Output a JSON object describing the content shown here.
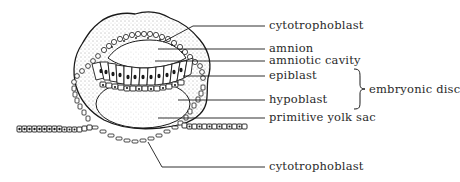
{
  "figure": {
    "title": "",
    "labels": [
      {
        "id": "cytotrophoblast-top",
        "text": "cytotrophoblast",
        "x": 269,
        "y": 20
      },
      {
        "id": "amnion",
        "text": "amnion",
        "x": 269,
        "y": 43
      },
      {
        "id": "amniotic-cavity",
        "text": "amniotic cavity",
        "x": 269,
        "y": 56
      },
      {
        "id": "epiblast",
        "text": "epiblast",
        "x": 269,
        "y": 71
      },
      {
        "id": "hypoblast",
        "text": "hypoblast",
        "x": 269,
        "y": 95
      },
      {
        "id": "primitive-yolk-sac",
        "text": "primitive yolk sac",
        "x": 269,
        "y": 113
      },
      {
        "id": "cytotrophoblast-bottom",
        "text": "cytotrophoblast",
        "x": 269,
        "y": 162
      }
    ],
    "group_label": {
      "id": "embryonic-disc",
      "text": "embryonic disc",
      "x": 369,
      "y": 84,
      "members": [
        "epiblast",
        "hypoblast"
      ]
    },
    "colors": {
      "ink": "#1a1a1a",
      "text": "#2a2a2a",
      "background": "#ffffff",
      "stipple": "#555555"
    }
  }
}
